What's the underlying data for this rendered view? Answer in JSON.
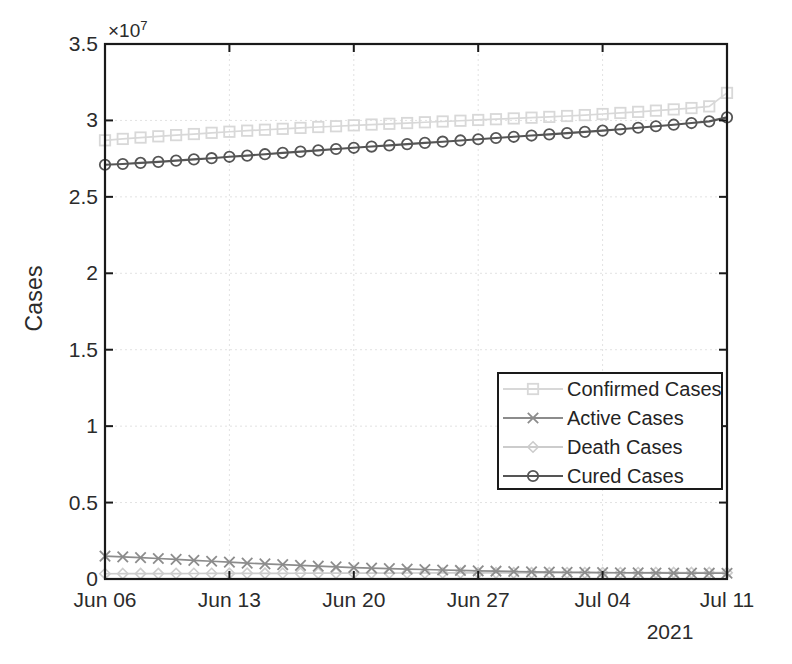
{
  "chart_data": {
    "type": "line",
    "title": "",
    "xlabel": "2021",
    "ylabel": "Cases",
    "y_multiplier": "×10",
    "y_exponent": "7",
    "ylim": [
      0,
      35000000
    ],
    "yticks": [
      0,
      5000000,
      10000000,
      15000000,
      20000000,
      25000000,
      30000000,
      35000000
    ],
    "ytick_labels": [
      "0",
      "0.5",
      "1",
      "1.5",
      "2",
      "2.5",
      "3",
      "3.5"
    ],
    "xtick_labels": [
      "Jun 06",
      "Jun 13",
      "Jun 20",
      "Jun 27",
      "Jul 04",
      "Jul 11"
    ],
    "x_start_day": 0,
    "x_end_day": 35,
    "grid": true,
    "legend_position": "center-right",
    "x": [
      0,
      1,
      2,
      3,
      4,
      5,
      6,
      7,
      8,
      9,
      10,
      11,
      12,
      13,
      14,
      15,
      16,
      17,
      18,
      19,
      20,
      21,
      22,
      23,
      24,
      25,
      26,
      27,
      28,
      29,
      30,
      31,
      32,
      33,
      34,
      35
    ],
    "series": [
      {
        "name": "Confirmed Cases",
        "marker": "square",
        "color": "#d8d8d8",
        "linestyle": "solid",
        "values": [
          28700000,
          28790000,
          28880000,
          28960000,
          29040000,
          29110000,
          29190000,
          29260000,
          29330000,
          29390000,
          29450000,
          29510000,
          29570000,
          29620000,
          29680000,
          29730000,
          29780000,
          29830000,
          29880000,
          29930000,
          29980000,
          30030000,
          30080000,
          30130000,
          30180000,
          30230000,
          30290000,
          30350000,
          30420000,
          30490000,
          30560000,
          30640000,
          30720000,
          30810000,
          30920000,
          31800000
        ]
      },
      {
        "name": "Active Cases",
        "marker": "x",
        "color": "#8c8c8c",
        "linestyle": "solid",
        "values": [
          1500000,
          1450000,
          1400000,
          1340000,
          1280000,
          1220000,
          1160000,
          1100000,
          1040000,
          990000,
          940000,
          890000,
          840000,
          790000,
          750000,
          710000,
          680000,
          650000,
          620000,
          590000,
          560000,
          530000,
          510000,
          490000,
          470000,
          450000,
          440000,
          430000,
          420000,
          410000,
          400000,
          395000,
          390000,
          385000,
          380000,
          375000
        ]
      },
      {
        "name": "Death Cases",
        "marker": "diamond",
        "color": "#cccccc",
        "linestyle": "solid",
        "values": [
          345000,
          348000,
          351000,
          354000,
          357000,
          360000,
          362000,
          365000,
          368000,
          371000,
          374000,
          377000,
          379000,
          382000,
          384000,
          387000,
          389000,
          391000,
          393000,
          395000,
          397000,
          399000,
          401000,
          402000,
          404000,
          406000,
          407000,
          408000,
          409000,
          410000,
          411000,
          412000,
          413000,
          414000,
          415000,
          416000
        ]
      },
      {
        "name": "Cured Cases",
        "marker": "circle",
        "color": "#555555",
        "linestyle": "solid",
        "values": [
          27100000,
          27150000,
          27220000,
          27290000,
          27370000,
          27450000,
          27530000,
          27620000,
          27700000,
          27790000,
          27880000,
          27960000,
          28040000,
          28130000,
          28210000,
          28290000,
          28370000,
          28450000,
          28530000,
          28610000,
          28690000,
          28770000,
          28850000,
          28930000,
          29010000,
          29090000,
          29170000,
          29250000,
          29330000,
          29420000,
          29520000,
          29620000,
          29720000,
          29830000,
          29940000,
          30200000
        ]
      }
    ]
  },
  "axes": {
    "yaxis_title": "Cases",
    "xaxis_year": "2021",
    "exp_prefix": "×10",
    "exp_power": "7"
  },
  "legend": {
    "items": [
      {
        "label": "Confirmed Cases",
        "marker": "square-marker",
        "color": "#d8d8d8"
      },
      {
        "label": "Active Cases",
        "marker": "x-marker",
        "color": "#8c8c8c"
      },
      {
        "label": "Death Cases",
        "marker": "diamond-marker",
        "color": "#cccccc"
      },
      {
        "label": "Cured Cases",
        "marker": "circle-marker",
        "color": "#555555"
      }
    ]
  }
}
